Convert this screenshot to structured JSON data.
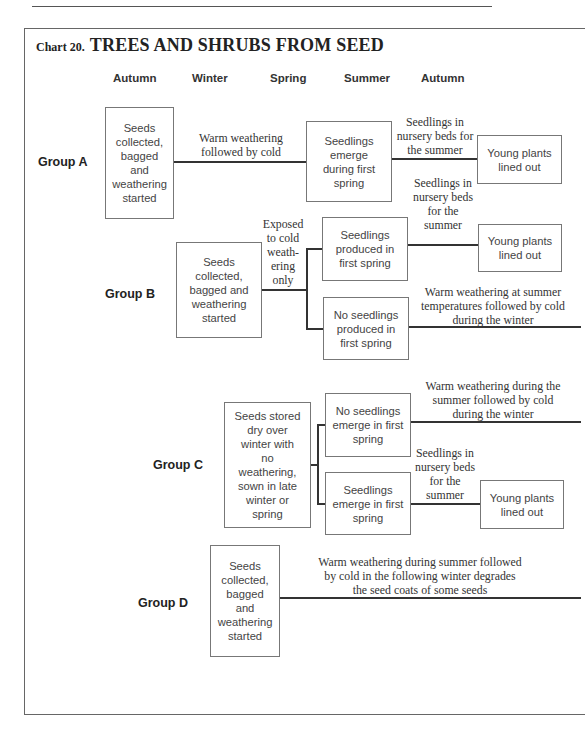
{
  "page": {
    "header_rule": true
  },
  "chart": {
    "prefix": "Chart 20.",
    "title": "TREES AND SHRUBS FROM SEED",
    "seasons": [
      "Autumn",
      "Winter",
      "Spring",
      "Summer",
      "Autumn"
    ]
  },
  "groups": {
    "A": {
      "label": "Group A",
      "start": "Seeds\ncollected,\nbagged\nand\nweathering\nstarted",
      "link1": "Warm weathering\nfollowed by cold",
      "mid": "Seedlings\nemerge\nduring first\nspring",
      "link2": "Seedlings in\nnursery beds for\nthe summer",
      "end": "Young plants\nlined out"
    },
    "B": {
      "label": "Group B",
      "start": "Seeds\ncollected,\nbagged and\nweathering\nstarted",
      "link1": "Exposed\nto cold\nweath-\nering\nonly",
      "branch_yes": "Seedlings\nproduced in\nfirst spring",
      "link_yes": "Seedlings in\nnursery beds\nfor the\nsummer",
      "end": "Young plants\nlined out",
      "branch_no": "No seedlings\nproduced in\nfirst spring",
      "link_no": "Warm weathering at summer\ntemperatures followed by cold\nduring the winter"
    },
    "C": {
      "label": "Group C",
      "start": "Seeds stored\ndry over\nwinter with\nno\nweathering,\nsown in late\nwinter or\nspring",
      "branch_no": "No seedlings\nemerge in first\nspring",
      "link_no": "Warm weathering during the\nsummer followed by cold\nduring the winter",
      "branch_yes": "Seedlings\nemerge in first\nspring",
      "link_yes": "Seedlings in\nnursery beds\nfor the\nsummer",
      "end": "Young plants\nlined out"
    },
    "D": {
      "label": "Group D",
      "start": "Seeds\ncollected,\nbagged\nand\nweathering\nstarted",
      "link1": "Warm weathering during summer followed\nby cold in the following winter degrades\nthe seed coats of some seeds"
    }
  }
}
